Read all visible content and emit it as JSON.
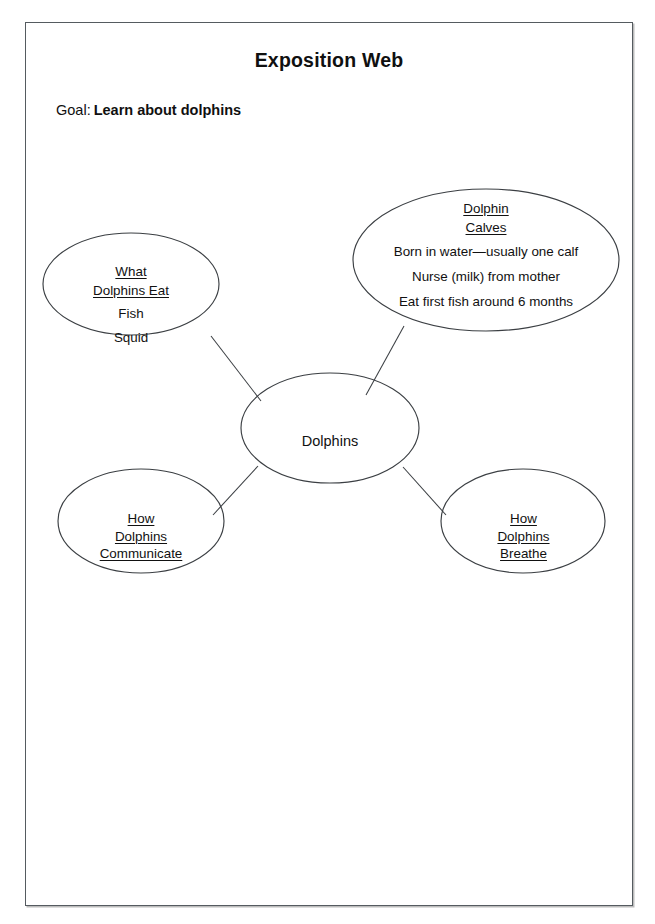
{
  "worksheet": {
    "title": "Exposition Web",
    "goal_label": "Goal:",
    "goal_value": "Learn about dolphins"
  },
  "diagram_data": {
    "type": "concept-web",
    "center": {
      "id": "dolphins",
      "label": "Dolphins",
      "underlined": false
    },
    "nodes": [
      {
        "id": "what-dolphins-eat",
        "heading_lines": [
          "What",
          "Dolphins Eat"
        ],
        "underlined": true,
        "items": [
          "Fish",
          "Squid"
        ]
      },
      {
        "id": "dolphin-calves",
        "heading_lines": [
          "Dolphin",
          "Calves"
        ],
        "underlined": true,
        "items": [
          "Born in water—usually one calf",
          "Nurse (milk) from mother",
          "Eat first fish around 6 months"
        ]
      },
      {
        "id": "how-dolphins-communicate",
        "heading_lines": [
          "How",
          "Dolphins",
          "Communicate"
        ],
        "underlined": true,
        "items": []
      },
      {
        "id": "how-dolphins-breathe",
        "heading_lines": [
          "How",
          "Dolphins",
          "Breathe"
        ],
        "underlined": true,
        "items": []
      }
    ],
    "connections": [
      {
        "from": "dolphins",
        "to": "what-dolphins-eat"
      },
      {
        "from": "dolphins",
        "to": "dolphin-calves"
      },
      {
        "from": "dolphins",
        "to": "how-dolphins-communicate"
      },
      {
        "from": "dolphins",
        "to": "how-dolphins-breathe"
      }
    ],
    "colors": {
      "stroke": "#3b3f43",
      "text": "#111111",
      "page_border": "#555b60",
      "background": "#ffffff"
    }
  }
}
